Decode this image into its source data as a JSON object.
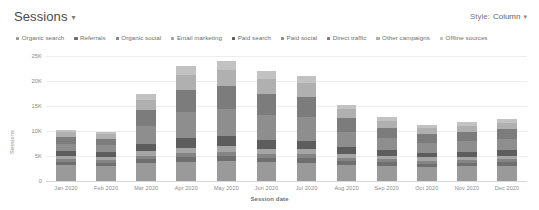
{
  "header": {
    "title": "Sessions",
    "title_caret": "▾",
    "style_label": "Style:",
    "style_value": "Column",
    "style_caret": "▾"
  },
  "chart_data": {
    "type": "bar",
    "stacked": true,
    "title": "Sessions",
    "xlabel": "Session date",
    "ylabel": "Sessions",
    "ylim": [
      0,
      25000
    ],
    "yticks": [
      "0",
      "5K",
      "10K",
      "15K",
      "20K",
      "25K"
    ],
    "ytick_values": [
      0,
      5000,
      10000,
      15000,
      20000,
      25000
    ],
    "grid": "horizontal",
    "legend_position": "top-left",
    "categories": [
      "Jan 2020",
      "Feb 2020",
      "Mar 2020",
      "Apr 2020",
      "May 2020",
      "Jun 2020",
      "Jul 2020",
      "Aug 2020",
      "Sep 2020",
      "Oct 2020",
      "Nov 2020",
      "Dec 2020"
    ],
    "series": [
      {
        "name": "Organic search",
        "color": "#9a9a9a",
        "values": [
          3200,
          3100,
          3600,
          3900,
          4000,
          3800,
          3700,
          3300,
          3100,
          2900,
          3000,
          3100
        ]
      },
      {
        "name": "Referrals",
        "color": "#6f6f6f",
        "values": [
          620,
          600,
          780,
          900,
          950,
          880,
          860,
          700,
          640,
          600,
          620,
          650
        ]
      },
      {
        "name": "Organic social",
        "color": "#848484",
        "values": [
          540,
          520,
          700,
          820,
          860,
          800,
          780,
          640,
          580,
          540,
          560,
          580
        ]
      },
      {
        "name": "Email marketing",
        "color": "#a5a5a5",
        "values": [
          700,
          680,
          900,
          1050,
          1100,
          1020,
          1000,
          820,
          740,
          700,
          720,
          760
        ]
      },
      {
        "name": "Paid search",
        "color": "#5d5d5d",
        "values": [
          900,
          860,
          1500,
          1900,
          2000,
          1800,
          1750,
          1250,
          1050,
          950,
          980,
          1020
        ]
      },
      {
        "name": "Paid social",
        "color": "#8e8e8e",
        "values": [
          1500,
          1400,
          3600,
          5200,
          5400,
          4900,
          4700,
          3100,
          2400,
          2000,
          2100,
          2200
        ]
      },
      {
        "name": "Direct traffic",
        "color": "#7c7c7c",
        "values": [
          1400,
          1300,
          3100,
          4400,
          4600,
          4200,
          4000,
          2700,
          2100,
          1800,
          1900,
          2000
        ]
      },
      {
        "name": "Other campaigns",
        "color": "#b0b0b0",
        "values": [
          900,
          850,
          2100,
          3100,
          3300,
          3000,
          2800,
          1800,
          1400,
          1150,
          1200,
          1300
        ]
      },
      {
        "name": "Offline sources",
        "color": "#c2c2c2",
        "values": [
          540,
          490,
          1220,
          1730,
          1790,
          1600,
          1410,
          990,
          790,
          660,
          720,
          790
        ]
      }
    ],
    "totals": [
      10300,
      9800,
      17500,
      23000,
      24000,
      22000,
      21000,
      15300,
      12800,
      11300,
      11800,
      12400
    ]
  }
}
